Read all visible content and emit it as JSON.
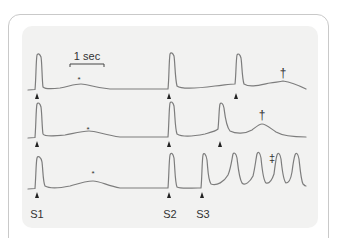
{
  "figure": {
    "scale_bar_label": "1 sec",
    "stimulus_labels": [
      "S1",
      "S2",
      "S3"
    ],
    "markers": {
      "asterisk": "*",
      "dagger": "†",
      "double_dagger": "‡"
    },
    "colors": {
      "trace": "#7d7d7d",
      "panel_bg": "#f2f2f1",
      "frame": "#c9c9c9",
      "text": "#333333"
    },
    "traces": [
      {
        "id": "trace-1",
        "description": "S1 response, S2 spike, S3 triggers spike followed by delayed afterdepolarization",
        "markers": [
          "*",
          "†"
        ]
      },
      {
        "id": "trace-2",
        "description": "S1 response, S2 spike, earlier S3 spike followed by larger afterdepolarization",
        "markers": [
          "*",
          "†"
        ]
      },
      {
        "id": "trace-3",
        "description": "S1 response, S2 spike, S3 triggers sustained repetitive firing",
        "markers": [
          "*",
          "‡"
        ]
      }
    ]
  }
}
